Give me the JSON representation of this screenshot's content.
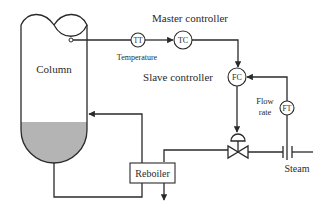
{
  "diagram": {
    "type": "cascade control loop (distillation column reboiler)",
    "labels": {
      "column": "Column",
      "master_controller": "Master controller",
      "slave_controller": "Slave controller",
      "temperature": "Temperature",
      "flow_rate_line1": "Flow",
      "flow_rate_line2": "rate",
      "reboiler": "Reboiler",
      "steam": "Steam"
    },
    "instruments": {
      "temperature_transmitter": "TT",
      "temperature_controller": "TC",
      "flow_controller": "FC",
      "flow_transmitter": "FT"
    },
    "colors": {
      "line": "#2a2a2a",
      "liquid": "#b4b4b4",
      "background": "#ffffff"
    },
    "connections": [
      "Column -> TT",
      "TT -> TC",
      "TC -> FC (setpoint)",
      "FT -> FC",
      "FC -> control valve",
      "Steam -> orifice -> control valve -> Reboiler",
      "Column bottom -> Reboiler -> Column"
    ]
  }
}
